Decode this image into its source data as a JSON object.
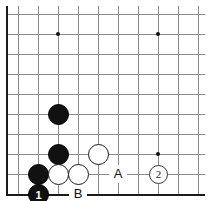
{
  "diagram": {
    "kind": "go-board-diagram",
    "grid": {
      "spacing": 20,
      "origin_x": 18,
      "origin_y": 14,
      "cols": 10,
      "rows": 9,
      "line_color": "#8a8a8a",
      "edge_color": "#1a1a1a",
      "background": "#ffffff"
    },
    "star_points": [
      {
        "x": 58,
        "y": 34
      },
      {
        "x": 158,
        "y": 34
      },
      {
        "x": 158,
        "y": 154
      }
    ],
    "stones": [
      {
        "color": "black",
        "x": 58,
        "y": 114,
        "number": ""
      },
      {
        "color": "black",
        "x": 58,
        "y": 154,
        "number": ""
      },
      {
        "color": "black",
        "x": 38,
        "y": 174,
        "number": ""
      },
      {
        "color": "black",
        "x": 38,
        "y": 194,
        "number": "1"
      },
      {
        "color": "white",
        "x": 58,
        "y": 174,
        "number": ""
      },
      {
        "color": "white",
        "x": 78,
        "y": 174,
        "number": ""
      },
      {
        "color": "white",
        "x": 98,
        "y": 154,
        "number": ""
      }
    ],
    "markers": [
      {
        "type": "circled-number",
        "label": "2",
        "x": 158,
        "y": 174
      }
    ],
    "point_labels": [
      {
        "label": "A",
        "x": 118,
        "y": 174
      },
      {
        "label": "B",
        "x": 78,
        "y": 194
      }
    ]
  }
}
